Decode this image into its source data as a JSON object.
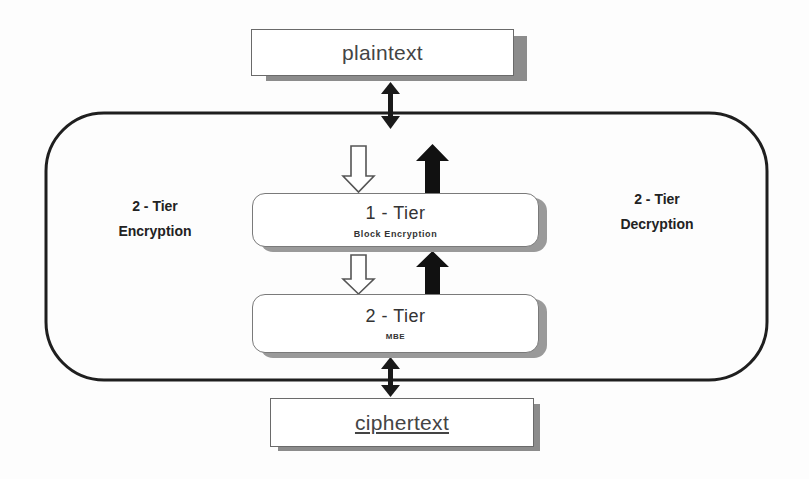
{
  "diagram": {
    "input": {
      "label": "plaintext"
    },
    "output": {
      "label": "ciphertext"
    },
    "left_label": {
      "line1": "2 - Tier",
      "line2": "Encryption"
    },
    "right_label": {
      "line1": "2 - Tier",
      "line2": "Decryption"
    },
    "tiers": [
      {
        "title": "1 - Tier",
        "subtitle": "Block Encryption"
      },
      {
        "title": "2 - Tier",
        "subtitle": "MBE"
      }
    ],
    "arrows": {
      "input_link": "bidirectional",
      "output_link": "bidirectional",
      "encryption_direction": "down (hollow arrows)",
      "decryption_direction": "up (solid arrows)"
    },
    "colors": {
      "stroke": "#1a1a1a",
      "shadow": "#8c8c8c",
      "box_fill": "#ffffff"
    }
  }
}
